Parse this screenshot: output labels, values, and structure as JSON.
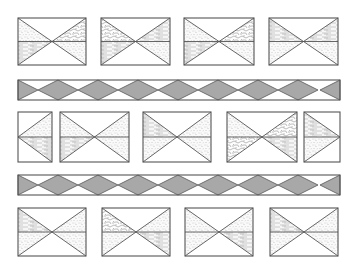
{
  "colors": {
    "line": "#555555",
    "diamond_fill": "#a8a8a8",
    "background": "#ffffff",
    "texture": "#9a9a9a"
  },
  "rows": [
    {
      "name": "tile-row-1",
      "y": 18,
      "h": 47,
      "tiles": [
        {
          "x": 18,
          "w": 68,
          "mid": "h",
          "fills": {
            "tl": "stipple",
            "bl": "wood",
            "tr": "cells",
            "br": "stipple"
          }
        },
        {
          "x": 101,
          "w": 69,
          "mid": "h",
          "fills": {
            "tl": "cells",
            "bl": "wood",
            "tr": "wood",
            "br": "stipple"
          }
        },
        {
          "x": 184,
          "w": 70,
          "mid": "h",
          "fills": {
            "tl": "stipple",
            "bl": "wood",
            "tr": "cells",
            "br": "stipple"
          }
        },
        {
          "x": 269,
          "w": 69,
          "mid": "h",
          "fills": {
            "tl": "wood",
            "bl": "stipple",
            "tr": "wood",
            "br": "stipple"
          }
        }
      ]
    },
    {
      "name": "tile-row-2",
      "y": 112,
      "h": 50,
      "tiles": [
        {
          "x": 18,
          "w": 34,
          "type": "left-half",
          "fills": {
            "tl": "stipple",
            "bl": "wood"
          }
        },
        {
          "x": 60,
          "w": 69,
          "mid": "h",
          "fills": {
            "tl": "stipple",
            "bl": "wood",
            "tr": "stipple",
            "br": "stipple"
          }
        },
        {
          "x": 143,
          "w": 68,
          "mid": "h",
          "fills": {
            "tl": "wood",
            "bl": "stipple",
            "tr": "stipple",
            "br": "stipple"
          }
        },
        {
          "x": 227,
          "w": 70,
          "mid": "h",
          "fills": {
            "tl": "stipple",
            "bl": "cells",
            "tr": "cells",
            "br": "wood"
          }
        },
        {
          "x": 304,
          "w": 36,
          "type": "right-half",
          "fills": {
            "tr": "wood",
            "br": "stipple"
          }
        }
      ]
    },
    {
      "name": "tile-row-3",
      "y": 208,
      "h": 48,
      "tiles": [
        {
          "x": 18,
          "w": 68,
          "mid": "h",
          "fills": {
            "tl": "wood",
            "bl": "stipple",
            "tr": "stipple",
            "br": "stipple"
          }
        },
        {
          "x": 102,
          "w": 68,
          "mid": "h",
          "fills": {
            "tl": "cells",
            "bl": "stipple",
            "tr": "stipple",
            "br": "wood"
          }
        },
        {
          "x": 185,
          "w": 68,
          "mid": "h",
          "fills": {
            "tl": "stipple",
            "bl": "stipple",
            "tr": "stipple",
            "br": "wood"
          }
        },
        {
          "x": 270,
          "w": 68,
          "mid": "h",
          "fills": {
            "tl": "wood",
            "bl": "stipple",
            "tr": "stipple",
            "br": "stipple"
          }
        }
      ]
    }
  ],
  "bands": [
    {
      "name": "diamond-band-1",
      "x": 18,
      "y": 80,
      "w": 322,
      "h": 20,
      "diamond_width": 40
    },
    {
      "name": "diamond-band-2",
      "x": 18,
      "y": 175,
      "w": 322,
      "h": 20,
      "diamond_width": 40
    }
  ]
}
